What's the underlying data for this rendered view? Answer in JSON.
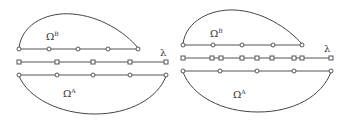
{
  "figure": {
    "panels": [
      {
        "name": "left",
        "label_top": "Ω",
        "label_top_sup": "B",
        "label_bottom": "Ω",
        "label_bottom_sup": "A",
        "lambda_label": "λ",
        "rows": [
          {
            "y": 49,
            "x_start": 19,
            "x_end": 138,
            "marker": "circle",
            "points": [
              19,
              49,
              78,
              108,
              138
            ]
          },
          {
            "y": 62,
            "x_start": 19,
            "x_end": 166,
            "marker": "square",
            "points": [
              19,
              57,
              93,
              130,
              166
            ]
          },
          {
            "y": 75,
            "x_start": 19,
            "x_end": 166,
            "marker": "circle",
            "points": [
              19,
              57,
              93,
              130,
              166
            ]
          }
        ],
        "arc_top": {
          "from": [
            19,
            48
          ],
          "to": [
            138,
            48
          ],
          "peak": [
            68,
            14
          ]
        },
        "arc_bottom": {
          "from": [
            19,
            76
          ],
          "to": [
            166,
            76
          ],
          "trough": [
            95,
            114
          ]
        },
        "label_top_pos": [
          46,
          40
        ],
        "label_bottom_pos": [
          63,
          97
        ],
        "lambda_pos": [
          160,
          56
        ]
      },
      {
        "name": "right",
        "label_top": "Ω",
        "label_top_sup": "B",
        "label_bottom": "Ω",
        "label_bottom_sup": "A",
        "lambda_label": "λ",
        "rows": [
          {
            "y": 45,
            "x_start": 183,
            "x_end": 302,
            "marker": "circle",
            "points": [
              183,
              213,
              242,
              273,
              302
            ]
          },
          {
            "y": 58,
            "x_start": 183,
            "x_end": 331,
            "marker": "square",
            "points": [
              183,
              212,
              221,
              242,
              257,
              272,
              294,
              302,
              331
            ]
          },
          {
            "y": 71,
            "x_start": 183,
            "x_end": 331,
            "marker": "circle",
            "points": [
              183,
              220,
              257,
              294,
              331
            ]
          }
        ],
        "arc_top": {
          "from": [
            183,
            44
          ],
          "to": [
            302,
            44
          ],
          "peak": [
            232,
            10
          ]
        },
        "arc_bottom": {
          "from": [
            183,
            72
          ],
          "to": [
            331,
            72
          ],
          "trough": [
            258,
            112
          ]
        },
        "label_top_pos": [
          210,
          37
        ],
        "label_bottom_pos": [
          233,
          98
        ],
        "lambda_pos": [
          324,
          52
        ]
      }
    ]
  }
}
